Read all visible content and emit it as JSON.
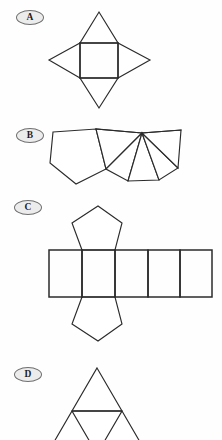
{
  "page": {
    "width": 222,
    "height": 440,
    "background_color": "#fefefe",
    "stroke_color": "#2b2b2b",
    "badge_fill_color": "#ececec",
    "badge_border_color": "#6f6f6f"
  },
  "options": [
    {
      "id": "A",
      "label": "A",
      "badge": {
        "x": 16,
        "y": 10
      },
      "figure_name": "square-pyramid-net",
      "description": "Square with four triangles attached to each side",
      "geometry": {
        "square": {
          "left": 80,
          "top": 43,
          "right": 118,
          "bottom": 78
        },
        "apex_top": {
          "x": 99,
          "y": 12
        },
        "apex_bottom": {
          "x": 99,
          "y": 108
        },
        "apex_left": {
          "x": 49,
          "y": 60
        },
        "apex_right": {
          "x": 150,
          "y": 60
        }
      }
    },
    {
      "id": "B",
      "label": "B",
      "badge": {
        "x": 16,
        "y": 128
      },
      "figure_name": "pentagonal-pyramid-net",
      "description": "Pentagon with five triangles fanning from a shared apex",
      "geometry": {
        "pentagon": [
          {
            "x": 53,
            "y": 132
          },
          {
            "x": 96,
            "y": 129
          },
          {
            "x": 106,
            "y": 169
          },
          {
            "x": 76,
            "y": 184
          },
          {
            "x": 50,
            "y": 163
          }
        ],
        "apex": {
          "x": 142,
          "y": 133
        },
        "fan_points": [
          {
            "x": 96,
            "y": 129
          },
          {
            "x": 106,
            "y": 169
          },
          {
            "x": 128,
            "y": 181
          },
          {
            "x": 159,
            "y": 180
          },
          {
            "x": 178,
            "y": 168
          },
          {
            "x": 181,
            "y": 130
          }
        ]
      }
    },
    {
      "id": "C",
      "label": "C",
      "badge": {
        "x": 14,
        "y": 200
      },
      "figure_name": "pentagonal-prism-net",
      "description": "Row of five rectangles with a pentagon above and below the second rectangle",
      "geometry": {
        "row": {
          "left": 49,
          "top": 250,
          "right": 212,
          "bottom": 297
        },
        "column_x": [
          49,
          82,
          115,
          148,
          180,
          212
        ],
        "top_pentagon": [
          {
            "x": 82,
            "y": 250
          },
          {
            "x": 72,
            "y": 223
          },
          {
            "x": 98,
            "y": 206
          },
          {
            "x": 122,
            "y": 223
          },
          {
            "x": 115,
            "y": 250
          }
        ],
        "bottom_pentagon": [
          {
            "x": 82,
            "y": 297
          },
          {
            "x": 72,
            "y": 324
          },
          {
            "x": 98,
            "y": 341
          },
          {
            "x": 122,
            "y": 324
          },
          {
            "x": 115,
            "y": 297
          }
        ]
      }
    },
    {
      "id": "D",
      "label": "D",
      "badge": {
        "x": 14,
        "y": 367
      },
      "figure_name": "tetrahedron-net",
      "description": "Large triangle subdivided into four smaller triangles, cropped at the bottom of the page",
      "geometry": {
        "apex": {
          "x": 97,
          "y": 368
        },
        "left_base": {
          "x": 47,
          "y": 454
        },
        "right_base": {
          "x": 147,
          "y": 454
        },
        "mid_left": {
          "x": 72,
          "y": 411
        },
        "mid_right": {
          "x": 122,
          "y": 411
        },
        "mid_bottom": {
          "x": 97,
          "y": 454
        }
      }
    }
  ]
}
